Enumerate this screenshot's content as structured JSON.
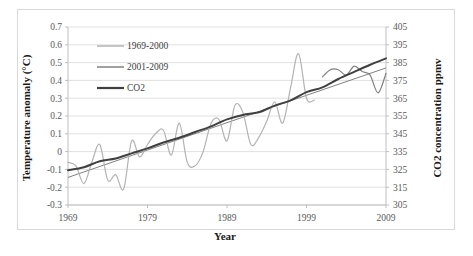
{
  "chart_data": {
    "type": "line",
    "title": "",
    "xlabel": "Year",
    "ylabel": "Temperature anomaly (°C)",
    "y2label": "CO2 concentration ppmv",
    "grid": true,
    "legend_position": "top-left-inside",
    "xlim": [
      1969,
      2009
    ],
    "ylim": [
      -0.3,
      0.7
    ],
    "y2lim": [
      305,
      405
    ],
    "xticks": [
      "1969",
      "1979",
      "1989",
      "1999",
      "2009"
    ],
    "xtick_values": [
      1969,
      1979,
      1989,
      1999,
      2009
    ],
    "yticks": [
      "0.7",
      "0.6",
      "0.5",
      "0.4",
      "0.3",
      "0.2",
      "0.1",
      "0",
      "-0.1",
      "-0.2",
      "-0.3"
    ],
    "ytick_values": [
      0.7,
      0.6,
      0.5,
      0.4,
      0.3,
      0.2,
      0.1,
      0,
      -0.1,
      -0.2,
      -0.3
    ],
    "y2ticks": [
      "405",
      "395",
      "385",
      "375",
      "365",
      "355",
      "345",
      "335",
      "325",
      "315",
      "305"
    ],
    "y2tick_values": [
      405,
      395,
      385,
      375,
      365,
      355,
      345,
      335,
      325,
      315,
      305
    ],
    "colors": {
      "series_1969_2000": "#b3b3b3",
      "series_2001_2009": "#808080",
      "series_co2": "#404040",
      "trendline": "#737373",
      "gridline": "#d9d9d9",
      "axis": "#bfbfbf"
    },
    "series": [
      {
        "name": "1969-2000",
        "axis": "left",
        "color": "#b3b3b3",
        "x": [
          1969,
          1970,
          1971,
          1972,
          1973,
          1974,
          1975,
          1976,
          1977,
          1978,
          1979,
          1980,
          1981,
          1982,
          1983,
          1984,
          1985,
          1986,
          1987,
          1988,
          1989,
          1990,
          1991,
          1992,
          1993,
          1994,
          1995,
          1996,
          1997,
          1998,
          1999,
          2000
        ],
        "values": [
          -0.06,
          -0.08,
          -0.18,
          -0.06,
          0.04,
          -0.16,
          -0.13,
          -0.21,
          0.06,
          -0.03,
          0.04,
          0.1,
          0.12,
          -0.02,
          0.16,
          -0.06,
          -0.08,
          0.0,
          0.16,
          0.18,
          0.06,
          0.26,
          0.22,
          0.04,
          0.08,
          0.17,
          0.28,
          0.16,
          0.36,
          0.55,
          0.3,
          0.29
        ]
      },
      {
        "name": "2001-2009",
        "axis": "left",
        "color": "#808080",
        "x": [
          2001,
          2002,
          2003,
          2004,
          2005,
          2006,
          2007,
          2008,
          2009
        ],
        "values": [
          0.42,
          0.46,
          0.46,
          0.43,
          0.48,
          0.45,
          0.43,
          0.33,
          0.44
        ]
      },
      {
        "name": "CO2",
        "axis": "right",
        "color": "#404040",
        "x": [
          1969,
          1971,
          1973,
          1975,
          1977,
          1979,
          1981,
          1983,
          1985,
          1987,
          1989,
          1991,
          1993,
          1995,
          1997,
          1999,
          2001,
          2003,
          2005,
          2007,
          2009
        ],
        "values": [
          324.5,
          326.2,
          329.6,
          331.1,
          334.0,
          336.8,
          340.1,
          342.8,
          346.0,
          349.2,
          353.1,
          355.6,
          357.1,
          360.8,
          363.8,
          368.4,
          371.1,
          375.8,
          379.8,
          383.8,
          387.4
        ]
      }
    ],
    "trendline": {
      "name": "linear-trend",
      "axis": "left",
      "color": "#737373",
      "x": [
        1969,
        2009
      ],
      "values": [
        -0.145,
        0.47
      ]
    },
    "legend": [
      {
        "label": "1969-2000",
        "color": "#b3b3b3"
      },
      {
        "label": "2001-2009",
        "color": "#808080"
      },
      {
        "label": "CO2",
        "color": "#404040"
      }
    ]
  }
}
